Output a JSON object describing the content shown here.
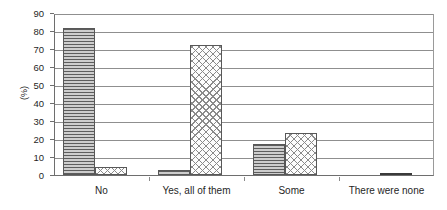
{
  "chart_data": {
    "type": "bar",
    "title": "",
    "xlabel": "",
    "ylabel": "(%)",
    "ylim": [
      0,
      90
    ],
    "ytick_step": 10,
    "yticks": [
      90,
      80,
      70,
      60,
      50,
      40,
      30,
      20,
      10,
      0
    ],
    "grid": true,
    "legend": "none",
    "categories": [
      "No",
      "Yes, all of them",
      "Some",
      "There were none"
    ],
    "series": [
      {
        "name": "series-1",
        "pattern": "horizontal-hatch",
        "values": [
          81.5,
          3.0,
          17.0,
          0
        ]
      },
      {
        "name": "series-2",
        "pattern": "diagonal-crosshatch",
        "values": [
          4.5,
          72.5,
          23.5,
          0.8
        ]
      }
    ]
  },
  "axis": {
    "y_title": "(%)",
    "y_tick_labels": [
      "90",
      "80",
      "70",
      "60",
      "50",
      "40",
      "30",
      "20",
      "10",
      "0"
    ]
  },
  "x_axis": {
    "labels": [
      "No",
      "Yes, all of them",
      "Some",
      "There were none"
    ]
  },
  "colors": {
    "axis": "#6e6e6e",
    "gridline": "#8f8f8f",
    "bar_border": "#585858",
    "hatch": "#5d5d5d",
    "background": "#ffffff"
  }
}
